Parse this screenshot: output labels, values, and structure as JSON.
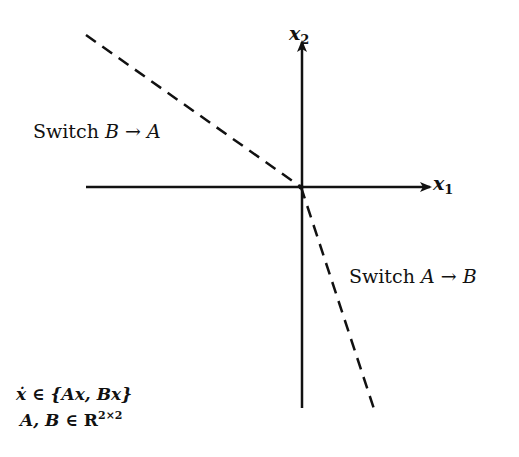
{
  "diagram": {
    "title": "",
    "axes": {
      "x_label_var": "x",
      "x_label_sub": "1",
      "y_label_var": "x",
      "y_label_sub": "2"
    },
    "regions": {
      "upper_left": {
        "prefix": "Switch",
        "from": "B",
        "arrow": "→",
        "to": "A"
      },
      "lower_right": {
        "prefix": "Switch",
        "from": "A",
        "arrow": "→",
        "to": "B"
      }
    },
    "formula": {
      "line1_lhs": "ẋ",
      "line1_in": "∈",
      "line1_set": "{Ax,  Bx}",
      "line2_vars": "A,  B",
      "line2_in": "∈",
      "line2_space": "R",
      "line2_exp": "2×2"
    },
    "style": {
      "stroke_color": "#111111",
      "background": "#ffffff"
    }
  }
}
